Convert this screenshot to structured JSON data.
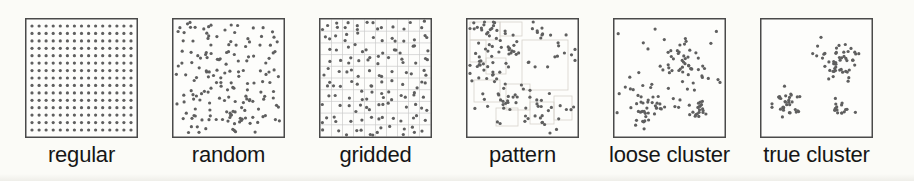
{
  "figure": {
    "background": "#fbfbf7",
    "panel_background": "#fdfdfb",
    "dot_color": "#5f5f5f",
    "border_color": "#4a4a4a",
    "grid_line_color": "#cccccc",
    "patch_line_color": "#d6d3cc",
    "label_color": "#161616",
    "dot_radius": 1.6
  },
  "panels": [
    {
      "id": "regular",
      "label": "regular",
      "type": "regular",
      "seed": 11,
      "rows": 15,
      "cols": 15,
      "margin_x": 7,
      "margin_y": 8
    },
    {
      "id": "random",
      "label": "random",
      "type": "uniform",
      "seed": 42,
      "count": 170
    },
    {
      "id": "gridded",
      "label": "gridded",
      "type": "stratified",
      "seed": 7,
      "grid_rows": 10,
      "grid_cols": 10,
      "per_cell": 1,
      "extra_prob": 0.55
    },
    {
      "id": "pattern",
      "label": "pattern",
      "type": "patches",
      "seed": 13,
      "background_count": 45,
      "rects": [
        [
          4,
          4,
          30,
          18
        ],
        [
          34,
          4,
          22,
          14
        ],
        [
          4,
          22,
          16,
          22
        ],
        [
          20,
          40,
          20,
          16
        ],
        [
          56,
          22,
          46,
          50
        ],
        [
          8,
          62,
          26,
          22
        ],
        [
          40,
          66,
          24,
          26
        ],
        [
          64,
          84,
          24,
          22
        ],
        [
          88,
          78,
          18,
          24
        ],
        [
          30,
          90,
          22,
          18
        ]
      ],
      "clusters": [
        {
          "x": 20,
          "y": 10,
          "sd": 9,
          "n": 16
        },
        {
          "x": 45,
          "y": 30,
          "sd": 8,
          "n": 14
        },
        {
          "x": 12,
          "y": 45,
          "sd": 8,
          "n": 10
        },
        {
          "x": 30,
          "y": 55,
          "sd": 7,
          "n": 8
        },
        {
          "x": 48,
          "y": 80,
          "sd": 9,
          "n": 16
        },
        {
          "x": 85,
          "y": 92,
          "sd": 9,
          "n": 14
        },
        {
          "x": 100,
          "y": 35,
          "sd": 6,
          "n": 8
        },
        {
          "x": 70,
          "y": 8,
          "sd": 7,
          "n": 8
        }
      ]
    },
    {
      "id": "loose-cluster",
      "label": "loose cluster",
      "type": "clusters",
      "seed": 99,
      "background_count": 30,
      "clusters": [
        {
          "x": 72,
          "y": 42,
          "sd": 13,
          "n": 40
        },
        {
          "x": 33,
          "y": 85,
          "sd": 11,
          "n": 35
        },
        {
          "x": 84,
          "y": 92,
          "sd": 5,
          "n": 20
        }
      ]
    },
    {
      "id": "true-cluster",
      "label": "true cluster",
      "type": "clusters",
      "seed": 5,
      "background_count": 0,
      "clusters": [
        {
          "x": 75,
          "y": 45,
          "sd": 12,
          "n": 50
        },
        {
          "x": 28,
          "y": 85,
          "sd": 8,
          "n": 32
        },
        {
          "x": 81,
          "y": 92,
          "sd": 4.5,
          "n": 16
        }
      ]
    }
  ]
}
